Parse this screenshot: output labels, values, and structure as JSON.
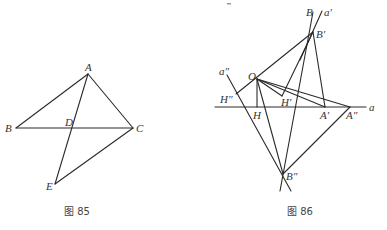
{
  "figures": [
    {
      "caption": "图 85",
      "points": {
        "A": "A",
        "B": "B",
        "C": "C",
        "D": "D",
        "E": "E"
      },
      "segments": [
        [
          "A",
          "B"
        ],
        [
          "B",
          "C"
        ],
        [
          "A",
          "C"
        ],
        [
          "A",
          "E"
        ],
        [
          "E",
          "C"
        ]
      ]
    },
    {
      "caption": "图 86",
      "labels": {
        "B": "B",
        "a_prime": "a′",
        "B_prime": "B′",
        "a_dprime": "a″",
        "O": "O",
        "H_dprime": "H″",
        "H_prime": "H′",
        "H": "H",
        "A_prime": "A′",
        "A_dprime": "A″",
        "a": "a",
        "B_dprime": "B″"
      },
      "segments": [
        [
          "line-a"
        ],
        [
          "O",
          "H"
        ],
        [
          "H''",
          "B'"
        ],
        [
          "O",
          "H'"
        ],
        [
          "B'",
          "H'"
        ],
        [
          "O",
          "A'"
        ],
        [
          "O",
          "A''"
        ],
        [
          "B'",
          "A'"
        ],
        [
          "B'",
          "B''"
        ],
        [
          "O",
          "B''"
        ],
        [
          "A''",
          "B''"
        ],
        [
          "a''-line"
        ],
        [
          "B-a'-line"
        ]
      ]
    }
  ]
}
